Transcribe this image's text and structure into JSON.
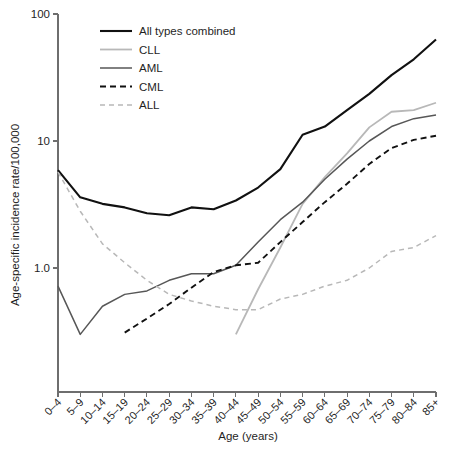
{
  "chart_data": {
    "type": "line",
    "title": "",
    "xlabel": "Age (years)",
    "ylabel": "Age-specific incidence rate/100,000",
    "yscale": "log",
    "ylim": [
      0.2,
      100
    ],
    "ytick_labels": [
      "100",
      "10",
      "1.0"
    ],
    "ytick_values": [
      100,
      10,
      1.0
    ],
    "grid": false,
    "legend_position": "top-left",
    "categories": [
      "0–4",
      "5–9",
      "10–14",
      "15–19",
      "20–24",
      "25–29",
      "30–34",
      "35–39",
      "40–44",
      "45–49",
      "50–54",
      "55–59",
      "60–64",
      "65–69",
      "70–74",
      "75–79",
      "80–84",
      "85+"
    ],
    "series": [
      {
        "name": "All types combined",
        "color": "#111111",
        "width": 2.1,
        "dash": "none",
        "values": [
          5.9,
          3.6,
          3.2,
          3.0,
          2.7,
          2.6,
          3.0,
          2.9,
          3.4,
          4.3,
          6.0,
          11.2,
          13.0,
          17.5,
          23.5,
          33.0,
          44.0,
          63.0
        ]
      },
      {
        "name": "CLL",
        "color": "#b8b8b8",
        "width": 1.8,
        "dash": "none",
        "values": [
          null,
          null,
          null,
          null,
          null,
          null,
          null,
          null,
          0.3,
          0.68,
          1.45,
          3.2,
          5.2,
          8.0,
          12.8,
          17.0,
          17.5,
          20.0
        ]
      },
      {
        "name": "AML",
        "color": "#575757",
        "width": 1.5,
        "dash": "none",
        "values": [
          0.72,
          0.3,
          0.5,
          0.62,
          0.66,
          0.8,
          0.9,
          0.9,
          1.05,
          1.6,
          2.4,
          3.3,
          5.0,
          7.2,
          10.0,
          13.0,
          15.0,
          16.0
        ]
      },
      {
        "name": "CML",
        "color": "#111111",
        "width": 1.9,
        "dash": "6,4",
        "values": [
          null,
          null,
          null,
          0.31,
          0.4,
          0.52,
          0.7,
          0.93,
          1.05,
          1.1,
          1.6,
          2.3,
          3.3,
          4.6,
          6.6,
          8.8,
          10.2,
          11.0
        ]
      },
      {
        "name": "ALL",
        "color": "#b8b8b8",
        "width": 1.5,
        "dash": "5,4",
        "values": [
          5.7,
          2.8,
          1.55,
          1.1,
          0.8,
          0.62,
          0.55,
          0.5,
          0.47,
          0.47,
          0.57,
          0.62,
          0.72,
          0.8,
          1.0,
          1.35,
          1.45,
          1.8
        ]
      }
    ]
  },
  "legend": {
    "entries": [
      {
        "label": "All types combined"
      },
      {
        "label": "CLL"
      },
      {
        "label": "AML"
      },
      {
        "label": "CML"
      },
      {
        "label": "ALL"
      }
    ]
  }
}
